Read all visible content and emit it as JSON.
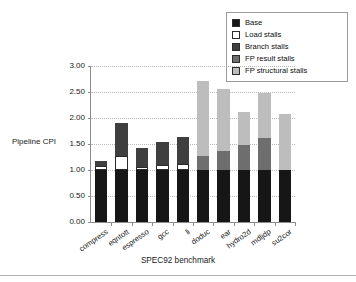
{
  "chart_data": {
    "type": "bar",
    "stacked": true,
    "title": "",
    "xlabel": "SPEC92 benchmark",
    "ylabel": "Pipeline CPI",
    "ylim": [
      0.0,
      3.0
    ],
    "ytick_labels": [
      "0.00",
      "0.50",
      "1.00",
      "1.50",
      "2.00",
      "2.50",
      "3.00"
    ],
    "ytick_values": [
      0.0,
      0.5,
      1.0,
      1.5,
      2.0,
      2.5,
      3.0
    ],
    "grid": true,
    "legend_position": "top-right",
    "categories": [
      "compress",
      "eqntott",
      "espresso",
      "gcc",
      "li",
      "doduc",
      "ear",
      "hydro2d",
      "mdljdp",
      "su2cor"
    ],
    "series": [
      {
        "name": "Base",
        "color": "#161616",
        "values": [
          1.0,
          1.0,
          1.0,
          1.0,
          1.0,
          1.0,
          1.0,
          1.0,
          1.0,
          1.0
        ]
      },
      {
        "name": "Load stalls",
        "color": "#ffffff",
        "values": [
          0.07,
          0.27,
          0.05,
          0.09,
          0.11,
          0.0,
          0.0,
          0.0,
          0.0,
          0.0
        ]
      },
      {
        "name": "Branch stalls",
        "color": "#3f3f3f",
        "values": [
          0.1,
          0.64,
          0.37,
          0.44,
          0.52,
          0.0,
          0.0,
          0.0,
          0.0,
          0.0
        ]
      },
      {
        "name": "FP result stalls",
        "color": "#6e6e6e",
        "values": [
          0.0,
          0.0,
          0.0,
          0.0,
          0.0,
          0.26,
          0.36,
          0.49,
          0.61,
          0.0
        ]
      },
      {
        "name": "FP structural stalls",
        "color": "#bdbdbd",
        "values": [
          0.0,
          0.0,
          0.0,
          0.0,
          0.0,
          1.46,
          1.2,
          0.62,
          0.88,
          1.08
        ]
      }
    ],
    "totals": [
      1.17,
      1.91,
      1.42,
      1.53,
      1.63,
      2.72,
      2.56,
      2.11,
      2.49,
      2.08
    ]
  },
  "legend": {
    "items": [
      {
        "label": "Base",
        "color": "#161616"
      },
      {
        "label": "Load stalls",
        "color": "#ffffff"
      },
      {
        "label": "Branch stalls",
        "color": "#3f3f3f"
      },
      {
        "label": "FP result stalls",
        "color": "#6e6e6e"
      },
      {
        "label": "FP structural stalls",
        "color": "#bdbdbd"
      }
    ]
  }
}
